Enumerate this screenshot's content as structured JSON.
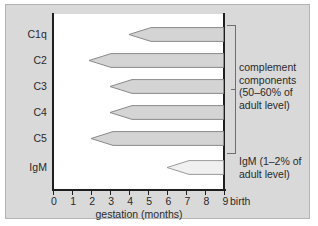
{
  "chart_data": {
    "type": "bar",
    "title": "",
    "xlabel": "gestation (months)",
    "ylabel": "",
    "xlim": [
      0,
      9
    ],
    "xticks": [
      "0",
      "1",
      "2",
      "3",
      "4",
      "5",
      "6",
      "7",
      "8",
      "9"
    ],
    "categories": [
      "C1q",
      "C2",
      "C3",
      "C4",
      "C5",
      "IgM"
    ],
    "orientation": "horizontal",
    "grid": false,
    "legend": "none",
    "note": "Each horizontal arrow spans from the gestational month of first appearance to birth (9 months); the left end is a pointed taper.",
    "series": [
      {
        "name": "appearance during gestation",
        "units": "months of gestation",
        "bars": [
          {
            "label": "C1q",
            "start": 4.0,
            "end": 9.0,
            "fill": "#d4d4d4",
            "stroke": "#8a8a8a"
          },
          {
            "label": "C2",
            "start": 1.9,
            "end": 9.0,
            "fill": "#d4d4d4",
            "stroke": "#8a8a8a"
          },
          {
            "label": "C3",
            "start": 3.0,
            "end": 9.0,
            "fill": "#d4d4d4",
            "stroke": "#8a8a8a"
          },
          {
            "label": "C4",
            "start": 3.0,
            "end": 9.0,
            "fill": "#d4d4d4",
            "stroke": "#8a8a8a"
          },
          {
            "label": "C5",
            "start": 2.0,
            "end": 9.0,
            "fill": "#d4d4d4",
            "stroke": "#8a8a8a"
          },
          {
            "label": "IgM",
            "start": 6.0,
            "end": 9.0,
            "fill": "#f0f0f0",
            "stroke": "#9a9a9a"
          }
        ]
      }
    ],
    "annotations": [
      {
        "id": "complement",
        "text": "complement components (50–60% of adult level)",
        "lines": [
          "complement",
          "components",
          "(50–60% of",
          "adult level)"
        ],
        "applies_to": [
          "C1q",
          "C2",
          "C3",
          "C4",
          "C5"
        ],
        "bracket": true
      },
      {
        "id": "igm",
        "text": "IgM (1–2% of adult level)",
        "lines": [
          "IgM (1–2% of",
          "adult level)"
        ],
        "applies_to": [
          "IgM"
        ],
        "bracket": false
      }
    ],
    "markers": [
      {
        "id": "birth",
        "label": "birth",
        "x": 9.0
      }
    ]
  },
  "axis": {
    "x_title": "gestation (months)",
    "ticks": [
      "0",
      "1",
      "2",
      "3",
      "4",
      "5",
      "6",
      "7",
      "8",
      "9"
    ],
    "birth_label": "birth"
  },
  "rows": [
    {
      "label": "C1q"
    },
    {
      "label": "C2"
    },
    {
      "label": "C3"
    },
    {
      "label": "C4"
    },
    {
      "label": "C5"
    },
    {
      "label": "IgM"
    }
  ],
  "annotations": {
    "complement": {
      "line1": "complement",
      "line2": "components",
      "line3": "(50–60% of",
      "line4": "adult level)"
    },
    "igm": {
      "line1": "IgM (1–2% of",
      "line2": "adult level)"
    }
  },
  "colors": {
    "panel_background": "#d9d9d9",
    "panel_border": "#b4b4b4",
    "plot_background": "#ffffff",
    "axis": "#1f1f1f",
    "complement_bar_fill": "#d4d4d4",
    "complement_bar_stroke": "#8a8a8a",
    "igm_bar_fill": "#f0f0f0",
    "igm_bar_stroke": "#9a9a9a",
    "bracket": "#6e6e6e",
    "text": "#2a2a2a"
  }
}
